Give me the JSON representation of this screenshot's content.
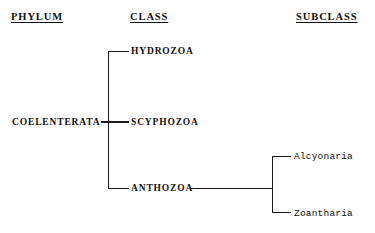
{
  "headers": {
    "phylum": "PHYLUM",
    "class": "CLASS",
    "subclass": "SUBCLASS"
  },
  "taxa": {
    "phylum": "COELENTERATA",
    "classes": [
      {
        "name": "HYDROZOA"
      },
      {
        "name": "SCYPHOZOA"
      },
      {
        "name": "ANTHOZOA"
      }
    ],
    "subclasses": [
      {
        "name": "Alcyonaria"
      },
      {
        "name": "Zoantharia"
      }
    ]
  },
  "style": {
    "line_color": "#1a1a1a",
    "text_color": "#111111",
    "background": "#ffffff"
  }
}
